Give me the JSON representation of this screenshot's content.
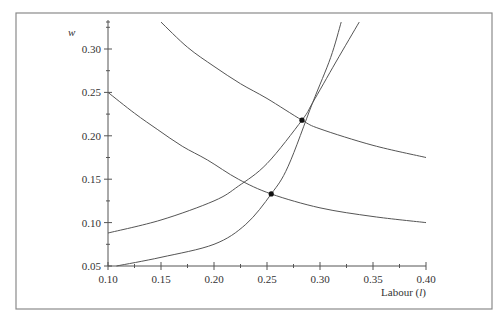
{
  "chart_data": {
    "type": "line",
    "title": "",
    "xlabel": "Labour (l)",
    "xlabel_parts": {
      "text": "Labour (",
      "italic": "l",
      "close": ")"
    },
    "ylabel": "w",
    "xlim": [
      0.1,
      0.4
    ],
    "ylim": [
      0.05,
      0.333
    ],
    "x_ticks": [
      0.1,
      0.15,
      0.2,
      0.25,
      0.3,
      0.35,
      0.4
    ],
    "x_tick_labels": [
      "0.10",
      "0.15",
      "0.20",
      "0.25",
      "0.30",
      "0.35",
      "0.40"
    ],
    "y_ticks": [
      0.05,
      0.1,
      0.15,
      0.2,
      0.25,
      0.3
    ],
    "y_tick_labels": [
      "0.05",
      "0.10",
      "0.15",
      "0.20",
      "0.25",
      "0.30"
    ],
    "grid": false,
    "legend": null,
    "series": [
      {
        "name": "upper demand curve",
        "x": [
          0.15,
          0.175,
          0.2,
          0.225,
          0.25,
          0.283,
          0.3,
          0.35,
          0.4
        ],
        "y": [
          0.331,
          0.302,
          0.28,
          0.26,
          0.243,
          0.218,
          0.208,
          0.189,
          0.175
        ]
      },
      {
        "name": "lower demand curve",
        "x": [
          0.1,
          0.125,
          0.147,
          0.17,
          0.194,
          0.223,
          0.254,
          0.3,
          0.35,
          0.4
        ],
        "y": [
          0.25,
          0.226,
          0.207,
          0.188,
          0.172,
          0.15,
          0.133,
          0.117,
          0.107,
          0.1
        ]
      },
      {
        "name": "upper supply curve",
        "x": [
          0.1,
          0.15,
          0.2,
          0.223,
          0.25,
          0.283,
          0.293,
          0.315,
          0.337
        ],
        "y": [
          0.088,
          0.103,
          0.125,
          0.142,
          0.168,
          0.218,
          0.238,
          0.285,
          0.331
        ]
      },
      {
        "name": "lower supply curve",
        "x": [
          0.108,
          0.15,
          0.2,
          0.23,
          0.254,
          0.27,
          0.293,
          0.31,
          0.32
        ],
        "y": [
          0.05,
          0.06,
          0.075,
          0.098,
          0.133,
          0.165,
          0.238,
          0.29,
          0.331
        ]
      }
    ],
    "points": [
      {
        "name": "upper equilibrium",
        "x": 0.283,
        "y": 0.218
      },
      {
        "name": "lower equilibrium",
        "x": 0.254,
        "y": 0.133
      }
    ]
  }
}
